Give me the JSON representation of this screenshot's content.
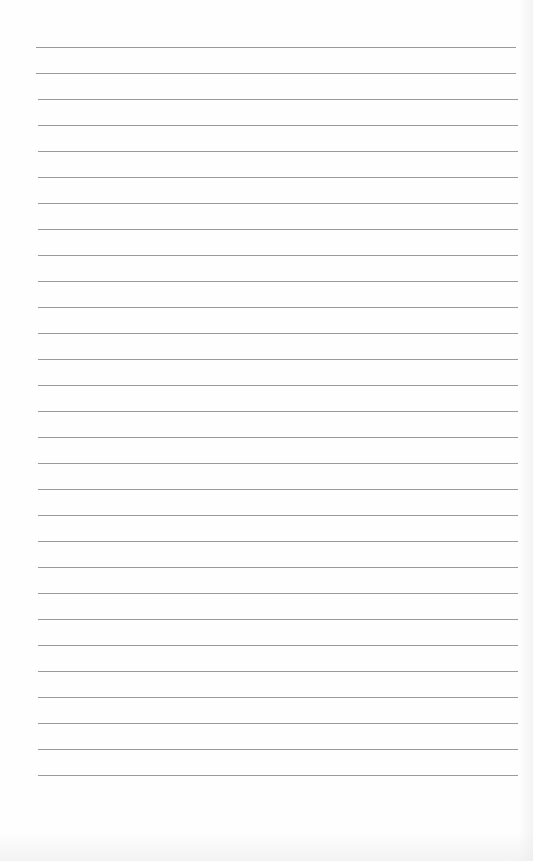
{
  "page": {
    "type": "lined-paper",
    "background_color": "#fefefe",
    "rule_color": "#9a9a9a",
    "rule_count": 29,
    "first_rule_y": 47,
    "rule_spacing": 26,
    "rule_left": 36,
    "rule_right": 516
  }
}
